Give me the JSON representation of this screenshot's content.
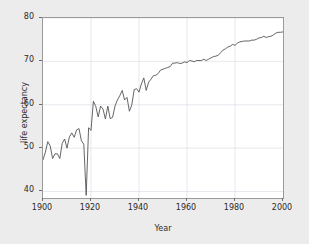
{
  "chart_data": {
    "type": "line",
    "title": "",
    "xlabel": "Year",
    "ylabel": "life expectancy",
    "xlim": [
      1900,
      2000
    ],
    "ylim": [
      38.5,
      80
    ],
    "xticks": [
      1900,
      1920,
      1940,
      1960,
      1980,
      2000
    ],
    "yticks": [
      40,
      50,
      60,
      70,
      80
    ],
    "grid": true,
    "legend": null,
    "line_color": "#555555",
    "panel_color": "#ffffff",
    "background_color": "#ececed",
    "series": [
      {
        "name": "life expectancy",
        "x": [
          1900,
          1901,
          1902,
          1903,
          1904,
          1905,
          1906,
          1907,
          1908,
          1909,
          1910,
          1911,
          1912,
          1913,
          1914,
          1915,
          1916,
          1917,
          1918,
          1919,
          1920,
          1921,
          1922,
          1923,
          1924,
          1925,
          1926,
          1927,
          1928,
          1929,
          1930,
          1931,
          1932,
          1933,
          1934,
          1935,
          1936,
          1937,
          1938,
          1939,
          1940,
          1941,
          1942,
          1943,
          1944,
          1945,
          1946,
          1947,
          1948,
          1949,
          1950,
          1951,
          1952,
          1953,
          1954,
          1955,
          1956,
          1957,
          1958,
          1959,
          1960,
          1961,
          1962,
          1963,
          1964,
          1965,
          1966,
          1967,
          1968,
          1969,
          1970,
          1971,
          1972,
          1973,
          1974,
          1975,
          1976,
          1977,
          1978,
          1979,
          1980,
          1981,
          1982,
          1983,
          1984,
          1985,
          1986,
          1987,
          1988,
          1989,
          1990,
          1991,
          1992,
          1993,
          1994,
          1995,
          1996,
          1997,
          1998,
          1999,
          2000
        ],
        "y": [
          47.3,
          49.1,
          51.5,
          50.5,
          47.6,
          48.7,
          48.7,
          47.6,
          51.1,
          52.1,
          50.0,
          52.6,
          53.5,
          52.5,
          54.2,
          54.5,
          51.7,
          50.9,
          39.1,
          54.7,
          54.1,
          60.8,
          59.6,
          57.2,
          59.7,
          59.0,
          56.7,
          59.7,
          56.8,
          57.1,
          59.7,
          61.1,
          62.1,
          63.3,
          61.1,
          61.7,
          58.5,
          60.0,
          63.5,
          63.7,
          62.9,
          64.8,
          66.2,
          63.3,
          65.2,
          65.9,
          66.7,
          66.8,
          67.2,
          68.0,
          68.2,
          68.4,
          68.6,
          68.8,
          69.6,
          69.6,
          69.7,
          69.5,
          69.6,
          69.9,
          69.7,
          70.2,
          70.1,
          69.9,
          70.2,
          70.2,
          70.2,
          70.5,
          70.2,
          70.5,
          70.8,
          71.1,
          71.2,
          71.4,
          72.0,
          72.6,
          72.9,
          73.3,
          73.5,
          73.9,
          73.7,
          74.2,
          74.5,
          74.6,
          74.7,
          74.7,
          74.7,
          74.9,
          74.9,
          75.1,
          75.4,
          75.5,
          75.8,
          75.5,
          75.7,
          75.8,
          76.1,
          76.5,
          76.7,
          76.7,
          76.8
        ]
      }
    ]
  },
  "axes": {
    "ylabel_text": "life expectancy",
    "xlabel_text": "Year",
    "ytick_labels": [
      "40",
      "50",
      "60",
      "70",
      "80"
    ],
    "xtick_labels": [
      "1900",
      "1920",
      "1940",
      "1960",
      "1980",
      "2000"
    ]
  }
}
